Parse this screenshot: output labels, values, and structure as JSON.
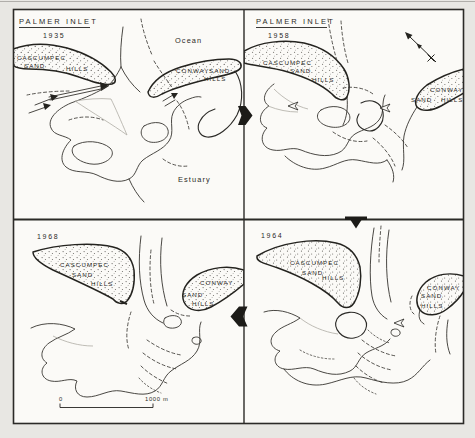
{
  "figure": {
    "colors": {
      "page_bg": "#e8e7e3",
      "panel_bg": "#fbfaf7",
      "ink": "#2b2a27",
      "faint_line": "#aeaca5"
    },
    "panels": {
      "p1935": {
        "title": "PALMER INLET",
        "year": "1935",
        "ocean": "Ocean",
        "estuary": "Estuary",
        "cascumpec": [
          "CASCUMPEC",
          "SAND",
          "HILLS"
        ],
        "conway": [
          "CONWAY",
          "SAND",
          "HILLS"
        ]
      },
      "p1958": {
        "title": "PALMER INLET",
        "year": "1958",
        "cascumpec": [
          "CASCUMPEC",
          "SAND",
          "HILLS"
        ],
        "conway": [
          "CONWAY",
          "SAND",
          "HILLS"
        ]
      },
      "p1968": {
        "year": "1968",
        "cascumpec": [
          "CASCUMPEC",
          "SAND",
          "HILLS"
        ],
        "conway": [
          "CONWAY",
          "SAND",
          "HILLS"
        ],
        "scale_bar": {
          "zero": "0",
          "length": "1000 m"
        }
      },
      "p1964": {
        "year": "1964",
        "cascumpec": [
          "CASCUMPEC",
          "SAND",
          "HILLS"
        ],
        "conway": [
          "CONWAY",
          "SAND",
          "HILLS"
        ]
      }
    }
  }
}
